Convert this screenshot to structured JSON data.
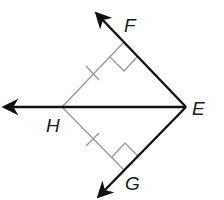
{
  "diagram": {
    "type": "geometry",
    "colors": {
      "ray": "#111111",
      "construction": "#9a9a9a",
      "label": "#1a1a1a",
      "background": "#ffffff"
    },
    "points": {
      "E": {
        "label": "E",
        "x": 186,
        "y": 107
      },
      "F": {
        "label": "F",
        "x": 123,
        "y": 42
      },
      "G": {
        "label": "G",
        "x": 124,
        "y": 170
      },
      "H": {
        "label": "H",
        "x": 62,
        "y": 107
      }
    },
    "rays": [
      {
        "name": "ray-EF",
        "from": "E",
        "through": "F"
      },
      {
        "name": "ray-EH",
        "from": "E",
        "through": "H"
      },
      {
        "name": "ray-EG",
        "from": "E",
        "through": "G"
      }
    ],
    "segments": [
      {
        "name": "segment-HF",
        "from": "H",
        "to": "F",
        "tick_marks": 1
      },
      {
        "name": "segment-HG",
        "from": "H",
        "to": "G",
        "tick_marks": 1
      }
    ],
    "right_angles": [
      "F",
      "G"
    ],
    "labels": {
      "E": "E",
      "F": "F",
      "G": "G",
      "H": "H"
    }
  }
}
